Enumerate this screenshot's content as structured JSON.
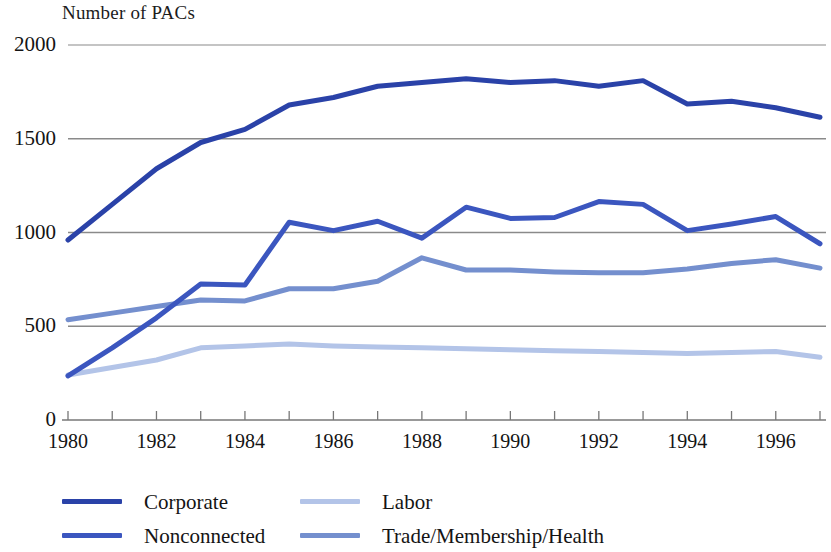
{
  "chart_data": {
    "type": "line",
    "title": "Number of PACs",
    "xlabel": "",
    "ylabel": "",
    "ylim": [
      0,
      2000
    ],
    "yticks": [
      0,
      500,
      1000,
      1500,
      2000
    ],
    "ytick_labels": [
      "0",
      "500",
      "1000",
      "1500",
      "2000"
    ],
    "xlim": [
      1980,
      1997
    ],
    "x": [
      1980,
      1981,
      1982,
      1983,
      1984,
      1985,
      1986,
      1987,
      1988,
      1989,
      1990,
      1991,
      1992,
      1993,
      1994,
      1995,
      1996,
      1997
    ],
    "xtick_labels": [
      "1980",
      "1982",
      "1984",
      "1986",
      "1988",
      "1990",
      "1992",
      "1994",
      "1996"
    ],
    "xticks": [
      1980,
      1982,
      1984,
      1986,
      1988,
      1990,
      1992,
      1994,
      1996
    ],
    "grid": "horizontal",
    "legend_position": "below",
    "series": [
      {
        "name": "Corporate",
        "color": "#2a42a8",
        "values": [
          960,
          1150,
          1340,
          1480,
          1550,
          1680,
          1720,
          1780,
          1800,
          1820,
          1800,
          1810,
          1780,
          1810,
          1685,
          1700,
          1665,
          1615
        ]
      },
      {
        "name": "Nonconnected",
        "color": "#3b56bf",
        "values": [
          235,
          385,
          545,
          725,
          720,
          1055,
          1010,
          1060,
          970,
          1135,
          1075,
          1080,
          1165,
          1150,
          1010,
          1045,
          1085,
          940
        ]
      },
      {
        "name": "Labor",
        "color": "#b3c4e8",
        "values": [
          240,
          280,
          320,
          385,
          395,
          405,
          395,
          390,
          385,
          380,
          375,
          370,
          365,
          360,
          355,
          360,
          365,
          335
        ]
      },
      {
        "name": "Trade/Membership/Health",
        "color": "#748fce",
        "values": [
          535,
          570,
          605,
          640,
          635,
          700,
          700,
          740,
          865,
          800,
          800,
          790,
          785,
          785,
          805,
          835,
          855,
          810
        ]
      }
    ]
  },
  "legend": {
    "items": [
      {
        "label": "Corporate",
        "color": "#2a42a8"
      },
      {
        "label": "Labor",
        "color": "#b3c4e8"
      },
      {
        "label": "Nonconnected",
        "color": "#3b56bf"
      },
      {
        "label": "Trade/Membership/Health",
        "color": "#748fce"
      }
    ]
  }
}
